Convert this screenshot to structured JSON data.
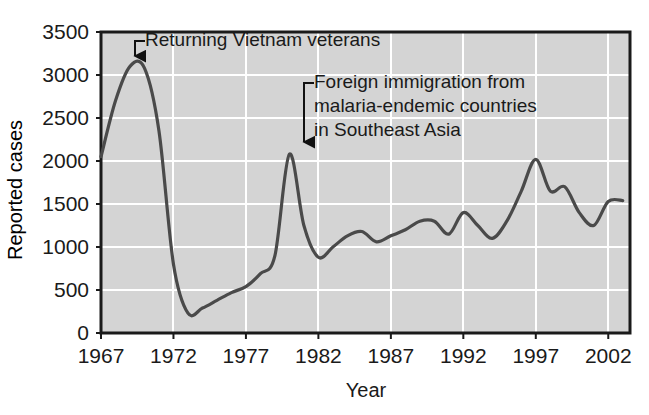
{
  "chart_data": {
    "type": "line",
    "title": "",
    "xlabel": "Year",
    "ylabel": "Reported cases",
    "xlim": [
      1967,
      2003.5
    ],
    "ylim": [
      0,
      3500
    ],
    "xticks": [
      "1967",
      "1972",
      "1977",
      "1982",
      "1987",
      "1992",
      "1997",
      "2002"
    ],
    "xtick_values": [
      1967,
      1972,
      1977,
      1982,
      1987,
      1992,
      1997,
      2002
    ],
    "yticks": [
      "0",
      "500",
      "1000",
      "1500",
      "2000",
      "2500",
      "3000",
      "3500"
    ],
    "ytick_values": [
      0,
      500,
      1000,
      1500,
      2000,
      2500,
      3000,
      3500
    ],
    "grid": true,
    "grid_color": "#ffffff",
    "plot_background": "#d4d4d4",
    "line_color": "#4a4a4a",
    "legend": "none",
    "x": [
      1967,
      1968,
      1969,
      1970,
      1971,
      1972,
      1973,
      1974,
      1975,
      1976,
      1977,
      1978,
      1979,
      1980,
      1981,
      1982,
      1983,
      1984,
      1985,
      1986,
      1987,
      1988,
      1989,
      1990,
      1991,
      1992,
      1993,
      1994,
      1995,
      1996,
      1997,
      1998,
      1999,
      2000,
      2001,
      2002,
      2003
    ],
    "values": [
      2050,
      2700,
      3100,
      3080,
      2350,
      800,
      230,
      290,
      380,
      470,
      540,
      690,
      900,
      2080,
      1250,
      880,
      1000,
      1130,
      1180,
      1060,
      1130,
      1200,
      1300,
      1300,
      1150,
      1400,
      1250,
      1100,
      1300,
      1650,
      2020,
      1650,
      1700,
      1400,
      1250,
      1530,
      1540
    ],
    "annotations": [
      {
        "name": "vietnam-veterans",
        "lines": [
          "Returning Vietnam veterans"
        ],
        "target_year": 1969.3,
        "target_value": 3080,
        "text_x": 145,
        "text_y": 46
      },
      {
        "name": "foreign-immigration",
        "lines": [
          "Foreign immigration from",
          "malaria-endemic countries",
          "in Southeast Asia"
        ],
        "target_year": 1980,
        "target_value": 2080,
        "text_x": 314,
        "text_y": 88
      }
    ]
  },
  "axes": {
    "y_axis_title": "Reported cases",
    "x_axis_title": "Year"
  }
}
